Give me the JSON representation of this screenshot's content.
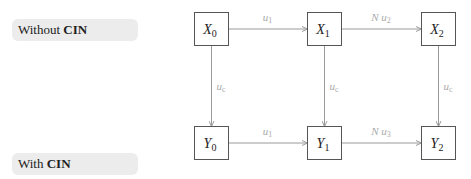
{
  "labels": {
    "without": {
      "prefix": "Without ",
      "bold": "CIN"
    },
    "with": {
      "prefix": "With ",
      "bold": "CIN"
    }
  },
  "nodes": [
    {
      "id": "X0",
      "var": "X",
      "sub": "0",
      "x": 194,
      "y": 12
    },
    {
      "id": "X1",
      "var": "X",
      "sub": "1",
      "x": 307,
      "y": 12
    },
    {
      "id": "X2",
      "var": "X",
      "sub": "2",
      "x": 421,
      "y": 12
    },
    {
      "id": "Y0",
      "var": "Y",
      "sub": "0",
      "x": 194,
      "y": 126
    },
    {
      "id": "Y1",
      "var": "Y",
      "sub": "1",
      "x": 307,
      "y": 126
    },
    {
      "id": "Y2",
      "var": "Y",
      "sub": "2",
      "x": 421,
      "y": 126
    }
  ],
  "edges": [
    {
      "from": "X0",
      "to": "X1",
      "label_pre": "",
      "label_var": "u",
      "label_sub": "1"
    },
    {
      "from": "X1",
      "to": "X2",
      "label_pre": "N ",
      "label_var": "u",
      "label_sub": "2"
    },
    {
      "from": "Y0",
      "to": "Y1",
      "label_pre": "",
      "label_var": "u",
      "label_sub": "1"
    },
    {
      "from": "Y1",
      "to": "Y2",
      "label_pre": "N ",
      "label_var": "u",
      "label_sub": "3"
    },
    {
      "from": "X0",
      "to": "Y0",
      "label_pre": "",
      "label_var": "u",
      "label_sub": "c"
    },
    {
      "from": "X1",
      "to": "Y1",
      "label_pre": "",
      "label_var": "u",
      "label_sub": "c"
    },
    {
      "from": "X2",
      "to": "Y2",
      "label_pre": "",
      "label_var": "u",
      "label_sub": "c"
    }
  ],
  "colors": {
    "box_stroke": "#555555",
    "arrow": "#9a9a9a",
    "edge_label": "#aaaaaa",
    "pill_bg": "#ececec"
  }
}
